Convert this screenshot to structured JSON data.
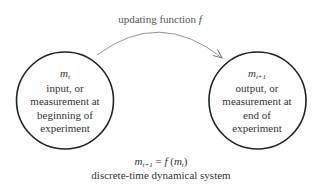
{
  "diagram": {
    "arrow": {
      "label_text": "updating function ",
      "label_fn": "f",
      "stroke_color": "#888888"
    },
    "nodes": [
      {
        "id": "left",
        "var_base": "m",
        "var_sub": "t",
        "lines": [
          "input, or",
          "measurement at",
          "beginning of",
          "experiment"
        ],
        "stroke_color": "#222222"
      },
      {
        "id": "right",
        "var_base": "m",
        "var_sub": "t+1",
        "lines": [
          "output, or",
          "measurement at",
          "end of",
          "experiment"
        ],
        "stroke_color": "#222222"
      }
    ],
    "equation": {
      "lhs_base": "m",
      "lhs_sub": "t+1",
      "equals": " = ",
      "fn": "f",
      "open": " (",
      "arg_base": "m",
      "arg_sub": "t",
      "close": ")"
    },
    "caption": "discrete-time dynamical system"
  }
}
